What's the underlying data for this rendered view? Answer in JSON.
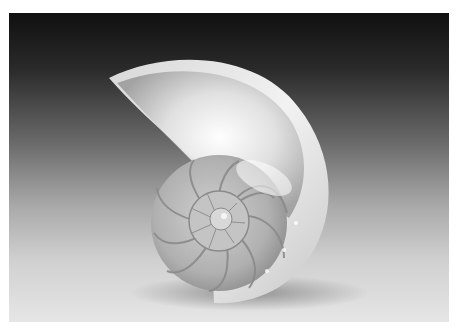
{
  "image": {
    "subject": "Cross-section of a nautilus shell",
    "style": "grayscale studio photograph",
    "background": "dark-to-light vertical gradient",
    "colors": {
      "border": "#ffffff",
      "background_top": "#101010",
      "background_bottom": "#e6e6e6",
      "shell_highlight": "#f4f4f4",
      "shell_mid": "#b8b8b8",
      "septa_lines": "#8a8a8a"
    }
  }
}
